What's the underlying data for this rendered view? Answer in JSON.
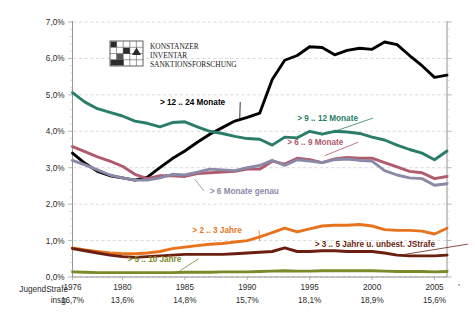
{
  "logo": {
    "line1": "KONSTANZER",
    "line2": "INVENTAR",
    "line3": "SANKTIONSFORSCHUNG",
    "icon": "grid-logo-icon"
  },
  "footer": {
    "caption_line1": "JugendStrafe",
    "caption_line2": "insg.",
    "values": [
      "16,7%",
      "13,6%",
      "14,8%",
      "15,7%",
      "18,1%",
      "18,9%",
      "15,6%"
    ],
    "value_years": [
      1976,
      1980,
      1985,
      1990,
      1995,
      2000,
      2005
    ]
  },
  "chart_data": {
    "type": "line",
    "title": "",
    "xlabel": "",
    "ylabel": "",
    "xlim": [
      1976,
      2006
    ],
    "ylim": [
      0.0,
      7.0
    ],
    "ytick_labels": [
      "0,0%",
      "1,0%",
      "2,0%",
      "3,0%",
      "4,0%",
      "5,0%",
      "6,0%",
      "7,0%"
    ],
    "ytick_values": [
      0,
      1,
      2,
      3,
      4,
      5,
      6,
      7
    ],
    "xtick_labels": [
      "1976",
      "1980",
      "1985",
      "1990",
      "1995",
      "2000",
      "2005"
    ],
    "xtick_values": [
      1976,
      1980,
      1985,
      1990,
      1995,
      2000,
      2005
    ],
    "grid": "horizontal-dashed",
    "legend": "inline-annotations",
    "x": [
      1976,
      1977,
      1978,
      1979,
      1980,
      1981,
      1982,
      1983,
      1984,
      1985,
      1986,
      1987,
      1988,
      1989,
      1990,
      1991,
      1992,
      1993,
      1994,
      1995,
      1996,
      1997,
      1998,
      1999,
      2000,
      2001,
      2002,
      2003,
      2004,
      2005,
      2006
    ],
    "series": [
      {
        "name": "> 12 .. 24 Monate",
        "color": "#000000",
        "label": "> 12 .. 24 Monate",
        "label_x": 1983.0,
        "label_y": 4.72,
        "values": [
          3.4,
          3.12,
          2.9,
          2.78,
          2.72,
          2.66,
          2.74,
          3.0,
          3.25,
          3.46,
          3.7,
          3.92,
          4.1,
          4.28,
          4.38,
          4.5,
          5.42,
          5.95,
          6.08,
          6.32,
          6.3,
          6.1,
          6.22,
          6.28,
          6.25,
          6.45,
          6.38,
          6.08,
          5.8,
          5.48,
          5.54
        ]
      },
      {
        "name": "> 9 .. 12 Monate",
        "color": "#2a7d68",
        "label": "> 9 .. 12 Monate",
        "label_x": 1994.0,
        "label_y": 4.28,
        "values": [
          5.06,
          4.8,
          4.62,
          4.52,
          4.42,
          4.28,
          4.22,
          4.12,
          4.24,
          4.26,
          4.12,
          4.0,
          3.94,
          3.86,
          3.8,
          3.78,
          3.62,
          3.84,
          3.82,
          4.0,
          3.92,
          4.0,
          3.98,
          3.94,
          3.84,
          3.76,
          3.62,
          3.5,
          3.4,
          3.22,
          3.46
        ]
      },
      {
        "name": "> 6 .. 9 Monate",
        "color": "#b05a6e",
        "label": "> 6 .. 9 Monate",
        "label_x": 1993.2,
        "label_y": 3.62,
        "values": [
          3.58,
          3.44,
          3.3,
          3.18,
          3.04,
          2.82,
          2.7,
          2.78,
          2.78,
          2.76,
          2.84,
          2.86,
          2.88,
          2.9,
          2.96,
          2.96,
          3.18,
          3.1,
          3.26,
          3.22,
          3.14,
          3.24,
          3.28,
          3.26,
          3.26,
          3.14,
          3.02,
          2.9,
          2.86,
          2.7,
          2.76
        ]
      },
      {
        "name": "> 6 Monate genau",
        "color": "#8a8aa8",
        "label": "> 6 Monate genau",
        "label_x": 1987.0,
        "label_y": 2.28,
        "values": [
          3.2,
          3.08,
          2.94,
          2.8,
          2.72,
          2.66,
          2.66,
          2.72,
          2.82,
          2.8,
          2.88,
          2.96,
          2.94,
          2.92,
          3.0,
          3.06,
          3.2,
          3.06,
          3.22,
          3.18,
          3.14,
          3.22,
          3.24,
          3.2,
          3.18,
          2.92,
          2.8,
          2.72,
          2.7,
          2.52,
          2.56
        ]
      },
      {
        "name": "> 2 .. 3 Jahre",
        "color": "#e8731e",
        "label": "> 2 .. 3 Jahre",
        "label_x": 1985.6,
        "label_y": 1.2,
        "values": [
          0.8,
          0.74,
          0.7,
          0.66,
          0.64,
          0.64,
          0.66,
          0.7,
          0.78,
          0.82,
          0.86,
          0.9,
          0.92,
          0.96,
          1.0,
          1.1,
          1.22,
          1.34,
          1.24,
          1.32,
          1.4,
          1.42,
          1.42,
          1.44,
          1.4,
          1.3,
          1.28,
          1.28,
          1.26,
          1.18,
          1.34
        ]
      },
      {
        "name": "> 3 .. 5 Jahre u. unbest. JStrafe",
        "color": "#6b1f10",
        "label": "> 3 .. 5 Jahre u. unbest. JStrafe",
        "label_x": 1995.4,
        "label_y": 0.82,
        "values": [
          0.78,
          0.72,
          0.66,
          0.6,
          0.56,
          0.54,
          0.56,
          0.58,
          0.6,
          0.62,
          0.62,
          0.62,
          0.62,
          0.64,
          0.66,
          0.68,
          0.7,
          0.8,
          0.7,
          0.7,
          0.72,
          0.72,
          0.7,
          0.7,
          0.7,
          0.66,
          0.6,
          0.58,
          0.58,
          0.58,
          0.6
        ]
      },
      {
        "name": "> 5 .. 10 Jahre",
        "color": "#7a8a28",
        "label": "> 5 .. 10 Jahre",
        "label_x": 1980.4,
        "label_y": 0.42,
        "values": [
          0.14,
          0.13,
          0.12,
          0.12,
          0.12,
          0.12,
          0.12,
          0.12,
          0.12,
          0.13,
          0.13,
          0.13,
          0.14,
          0.14,
          0.14,
          0.15,
          0.16,
          0.17,
          0.16,
          0.16,
          0.17,
          0.17,
          0.17,
          0.17,
          0.17,
          0.16,
          0.15,
          0.15,
          0.15,
          0.14,
          0.15
        ]
      }
    ]
  }
}
